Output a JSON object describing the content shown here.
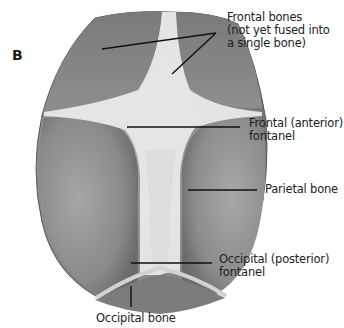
{
  "figure": {
    "panel_letter": "B",
    "colors": {
      "bone": "#8f8f8f",
      "bone_dark": "#6e6e6e",
      "fontanel": "#ececec",
      "suture": "#d6d6d6",
      "leader_line": "#111111",
      "text": "#222222"
    }
  },
  "labels": [
    {
      "id": "frontal-bones",
      "text": "Frontal bones\n(not yet fused into\na single bone)"
    },
    {
      "id": "frontal-fontanel",
      "text": "Frontal (anterior)\nfontanel"
    },
    {
      "id": "parietal-bone",
      "text": "Parietal bone"
    },
    {
      "id": "occipital-fontanel",
      "text": "Occipital (posterior)\nfontanel"
    },
    {
      "id": "occipital-bone",
      "text": "Occipital bone"
    }
  ]
}
